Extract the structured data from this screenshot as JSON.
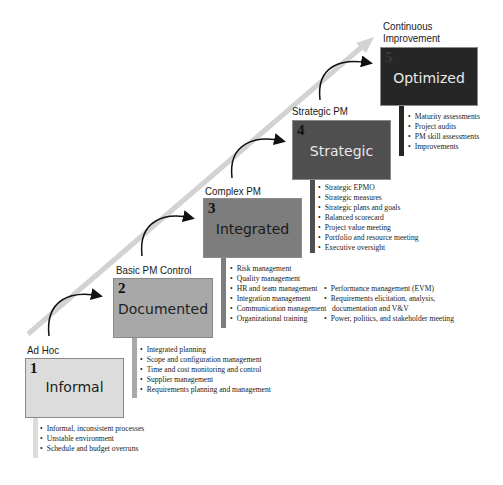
{
  "diagram": {
    "type": "staircase-maturity-model",
    "colors": {
      "arrow": "#d2d2d2",
      "level1": "#dcdcdc",
      "level2": "#a8a8a8",
      "level3": "#7d7d7d",
      "level4": "#4f4f4f",
      "level5": "#262626"
    },
    "levels": [
      {
        "number": "1",
        "stage": "Ad Hoc",
        "title": "Informal",
        "bullets": [
          "Informal, inconsistent processes",
          "Unstable environment",
          "Schedule and budget overruns"
        ]
      },
      {
        "number": "2",
        "stage": "Basic PM Control",
        "title": "Documented",
        "bullets": [
          "Integrated planning",
          "Scope and configuration management",
          "Time and cost monitoring and control",
          "Supplier management",
          "Requirements planning and management"
        ]
      },
      {
        "number": "3",
        "stage": "Complex PM",
        "title": "Integrated",
        "bullets": [
          "Risk management",
          "Quality management",
          "HR and team management",
          "Integration management",
          "Communication management",
          "Organizational training"
        ],
        "bullets_extra": [
          "Performance management (EVM)",
          "Requirements elicitation, analysis,",
          "documentation and V&V",
          "Power, politics, and stakeholder meeting"
        ]
      },
      {
        "number": "4",
        "stage": "Strategic PM",
        "title": "Strategic",
        "bullets": [
          "Strategic EPMO",
          "Strategic measures",
          "Strategic plans and goals",
          "Balanced scorecard",
          "Project value meeting",
          "Portfolio and resource meeting",
          "Executive oversight"
        ]
      },
      {
        "number": "5",
        "stage_line1": "Continuous",
        "stage_line2": "Improvement",
        "title": "Optimized",
        "bullets": [
          "Maturity assessments",
          "Project audits",
          "PM skill assessments",
          "Improvements"
        ]
      }
    ]
  }
}
